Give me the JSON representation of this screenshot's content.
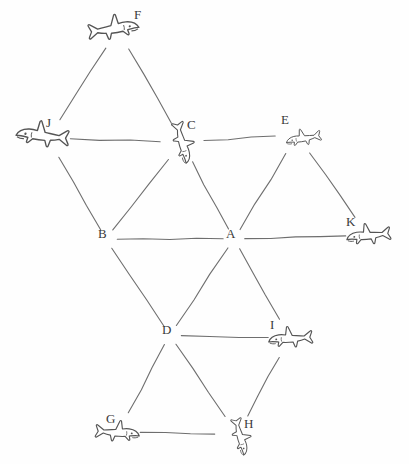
{
  "diagram": {
    "style": {
      "background": "#fefefe",
      "ink": "#555555",
      "label_color": "#3a3a3a",
      "edge_width": 1.1
    },
    "nodes": [
      {
        "id": "F",
        "label": "F",
        "x": 118,
        "y": 30,
        "kind": "shark",
        "facing": "right",
        "label_dx": 20,
        "label_dy": -16,
        "scale": 1.15,
        "rot": -8
      },
      {
        "id": "J",
        "label": "J",
        "x": 48,
        "y": 138,
        "kind": "shark",
        "facing": "left",
        "label_dx": 2,
        "label_dy": -16,
        "scale": 1.2,
        "rot": 6
      },
      {
        "id": "C",
        "label": "C",
        "x": 182,
        "y": 142,
        "kind": "shark",
        "facing": "down",
        "label_dx": 9,
        "label_dy": -18,
        "scale": 0.95,
        "rot": 0
      },
      {
        "id": "E",
        "label": "E",
        "x": 297,
        "y": 135,
        "kind": "shark",
        "facing": "left",
        "label_dx": -12,
        "label_dy": -16,
        "scale": 0.8,
        "rot": -10
      },
      {
        "id": "B",
        "label": "B",
        "x": 106,
        "y": 239,
        "kind": "point",
        "label_dx": -4,
        "label_dy": -6,
        "scale": 1,
        "rot": 0
      },
      {
        "id": "A",
        "label": "A",
        "x": 234,
        "y": 239,
        "kind": "point",
        "label_dx": -4,
        "label_dy": -6,
        "scale": 1,
        "rot": 0
      },
      {
        "id": "K",
        "label": "K",
        "x": 368,
        "y": 235,
        "kind": "shark",
        "facing": "left",
        "label_dx": -18,
        "label_dy": -14,
        "scale": 1.0,
        "rot": -6
      },
      {
        "id": "D",
        "label": "D",
        "x": 170,
        "y": 335,
        "kind": "point",
        "label_dx": -4,
        "label_dy": -6,
        "scale": 1,
        "rot": 0
      },
      {
        "id": "I",
        "label": "I",
        "x": 290,
        "y": 338,
        "kind": "shark",
        "facing": "left",
        "label_dx": -16,
        "label_dy": -14,
        "scale": 1.0,
        "rot": -4
      },
      {
        "id": "G",
        "label": "G",
        "x": 118,
        "y": 432,
        "kind": "shark",
        "facing": "right",
        "label_dx": -8,
        "label_dy": -14,
        "scale": 1.0,
        "rot": 4
      },
      {
        "id": "H",
        "label": "H",
        "x": 237,
        "y": 435,
        "kind": "shark",
        "facing": "down",
        "label_dx": 11,
        "label_dy": -12,
        "scale": 0.85,
        "rot": 0
      }
    ],
    "edges": [
      {
        "from": "F",
        "to": "J"
      },
      {
        "from": "F",
        "to": "C"
      },
      {
        "from": "J",
        "to": "C"
      },
      {
        "from": "J",
        "to": "B"
      },
      {
        "from": "C",
        "to": "B"
      },
      {
        "from": "C",
        "to": "A"
      },
      {
        "from": "C",
        "to": "E"
      },
      {
        "from": "E",
        "to": "A"
      },
      {
        "from": "E",
        "to": "K"
      },
      {
        "from": "A",
        "to": "B"
      },
      {
        "from": "A",
        "to": "K"
      },
      {
        "from": "B",
        "to": "D"
      },
      {
        "from": "A",
        "to": "D"
      },
      {
        "from": "A",
        "to": "I"
      },
      {
        "from": "D",
        "to": "I"
      },
      {
        "from": "D",
        "to": "G"
      },
      {
        "from": "D",
        "to": "H"
      },
      {
        "from": "I",
        "to": "H"
      },
      {
        "from": "G",
        "to": "H"
      }
    ]
  }
}
